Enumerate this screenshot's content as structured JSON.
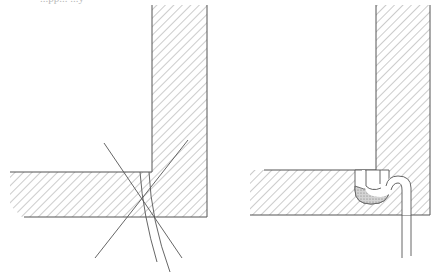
{
  "figure": {
    "caption_fragment": "...pp... ...y",
    "colors": {
      "ink": "#555555",
      "hatch": "#9a9a9a",
      "fill_sealant": "#b8b8b8",
      "background": "#ffffff"
    }
  },
  "panels": [
    {
      "id": "left",
      "description": "L-shaped joint cross-section with crossing reference lines",
      "vertical_member": {
        "x": 152,
        "y": 0,
        "w": 55,
        "h": 217
      },
      "horizontal_member": {
        "x": 10,
        "y": 172,
        "w": 197,
        "h": 45
      },
      "lines": [
        {
          "x1": 104,
          "y1": 143,
          "x2": 182,
          "y2": 258
        },
        {
          "x1": 188,
          "y1": 140,
          "x2": 95,
          "y2": 258
        }
      ],
      "curves": [
        {
          "d": "M140 172 Q143 215 157 262"
        },
        {
          "d": "M149 172 Q151 220 170 272"
        }
      ]
    },
    {
      "id": "right",
      "description": "L-shaped joint cross-section with U-shaped sealant pocket and looped strip",
      "vertical_member": {
        "x": 376,
        "y": 0,
        "w": 54,
        "h": 215
      },
      "horizontal_member": {
        "x": 250,
        "y": 170,
        "w": 180,
        "h": 45
      },
      "pocket": {
        "x": 355,
        "y": 170,
        "w": 32,
        "h": 34
      },
      "strip_lines": [
        {
          "x": 402,
          "y1": 185,
          "y2": 258
        },
        {
          "x": 411,
          "y1": 183,
          "y2": 256
        }
      ]
    }
  ]
}
